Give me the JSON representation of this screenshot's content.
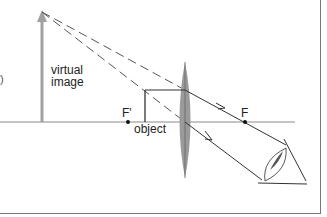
{
  "diagram": {
    "labels": {
      "virtual_line1": "virtual",
      "virtual_line2": "image",
      "object": "object",
      "focal_near": "F'",
      "focal_far": "F",
      "edge_paren": ")"
    },
    "colors": {
      "axis": "#888888",
      "rays": "#333333",
      "dashed_rays": "#555555",
      "virtual_image": "#a0a0a0",
      "lens": "#9a9a9a",
      "border": "#666666"
    },
    "elements": {
      "optical_axis": {
        "y": 122,
        "x_start": 0,
        "x_end": 295
      },
      "virtual_image_arrow": {
        "x": 42,
        "y_base": 122,
        "y_tip": 12
      },
      "object_arrow": {
        "x": 145,
        "y_base": 122,
        "y_tip": 90
      },
      "lens": {
        "x": 185,
        "y_top": 62,
        "y_bottom": 178
      },
      "focal_points": [
        {
          "name": "F'",
          "x": 128
        },
        {
          "name": "F",
          "x": 245
        }
      ],
      "eye": {
        "x": 285,
        "y": 160
      }
    }
  }
}
